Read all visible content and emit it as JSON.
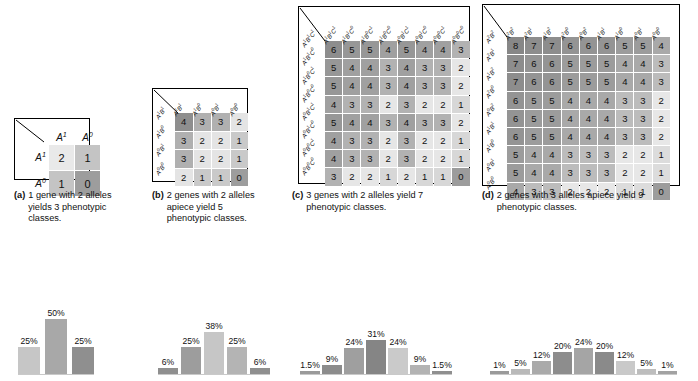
{
  "panels": [
    {
      "id": "a",
      "tag": "(a)",
      "caption": "1 gene with 2 alleles yields 3 phenotypic classes.",
      "col_labels": [
        "A1",
        "A0"
      ],
      "row_labels": [
        "A1",
        "A0"
      ],
      "col_labels_html": [
        "A<sup>1</sup>",
        "A<sup>0</sup>"
      ],
      "row_labels_html": [
        "A<sup>1</sup>",
        "A<sup>0</sup>"
      ],
      "label_style": "plain",
      "matrix": [
        [
          2,
          1
        ],
        [
          1,
          0
        ]
      ]
    },
    {
      "id": "b",
      "tag": "(b)",
      "caption": "2 genes with 2 alleles apiece yield 5 phenotypic classes.",
      "col_labels": [
        "A1B1",
        "A1B0",
        "A0B1",
        "A0B0"
      ],
      "row_labels": [
        "A1B1",
        "A1B0",
        "A0B1",
        "A0B0"
      ],
      "label_style": "diagonal",
      "matrix": [
        [
          4,
          3,
          3,
          2
        ],
        [
          3,
          2,
          2,
          1
        ],
        [
          3,
          2,
          2,
          1
        ],
        [
          2,
          1,
          1,
          0
        ]
      ]
    },
    {
      "id": "c",
      "tag": "(c)",
      "caption": "3 genes with 2 alleles yield 7 phenotypic classes.",
      "col_labels": [
        "A1B1C1",
        "A1B1C0",
        "A1B0C1",
        "A1B0C0",
        "A0B1C1",
        "A0B1C0",
        "A0B0C1",
        "A0B0C0"
      ],
      "row_labels": [
        "A1B1C1",
        "A1B1C0",
        "A1B0C1",
        "A1B0C0",
        "A0B1C1",
        "A0B1C0",
        "A0B0C1",
        "A0B0C0"
      ],
      "label_style": "diagonal",
      "matrix": [
        [
          6,
          5,
          5,
          4,
          5,
          4,
          4,
          3
        ],
        [
          5,
          4,
          4,
          3,
          4,
          3,
          3,
          2
        ],
        [
          5,
          4,
          4,
          3,
          4,
          3,
          3,
          2
        ],
        [
          4,
          3,
          3,
          2,
          3,
          2,
          2,
          1
        ],
        [
          5,
          4,
          4,
          3,
          4,
          3,
          3,
          2
        ],
        [
          4,
          3,
          3,
          2,
          3,
          2,
          2,
          1
        ],
        [
          4,
          3,
          3,
          2,
          3,
          2,
          2,
          1
        ],
        [
          3,
          2,
          2,
          1,
          2,
          1,
          1,
          0
        ]
      ]
    },
    {
      "id": "d",
      "tag": "(d)",
      "caption": "2 genes with 3 alleles apiece yield 9 phenotypic classes.",
      "col_labels": [
        "A2B2",
        "A2B1",
        "A1B2",
        "A2B0",
        "A0B2",
        "A1B1",
        "A1B0",
        "A0B1",
        "A0B0"
      ],
      "row_labels": [
        "A2B2",
        "A2B1",
        "A1B2",
        "A2B0",
        "A0B2",
        "A1B1",
        "A1B0",
        "A0B1",
        "A0B0"
      ],
      "label_style": "diagonal",
      "matrix": [
        [
          8,
          7,
          7,
          6,
          6,
          6,
          5,
          5,
          4
        ],
        [
          7,
          6,
          6,
          5,
          5,
          5,
          4,
          4,
          3
        ],
        [
          7,
          6,
          6,
          5,
          5,
          5,
          4,
          4,
          3
        ],
        [
          6,
          5,
          5,
          4,
          4,
          4,
          3,
          3,
          2
        ],
        [
          6,
          5,
          5,
          4,
          4,
          4,
          3,
          3,
          2
        ],
        [
          6,
          5,
          5,
          4,
          4,
          4,
          3,
          3,
          2
        ],
        [
          5,
          4,
          4,
          3,
          3,
          3,
          2,
          2,
          1
        ],
        [
          5,
          4,
          4,
          3,
          3,
          3,
          2,
          2,
          1
        ],
        [
          4,
          3,
          3,
          2,
          2,
          2,
          1,
          1,
          0
        ]
      ]
    }
  ],
  "chart_data": [
    {
      "type": "bar",
      "id": "chart-a",
      "title": "",
      "xlabel": "",
      "ylabel": "",
      "categories": [
        "0",
        "1",
        "2"
      ],
      "values": [
        25,
        50,
        25
      ],
      "labels": [
        "25%",
        "50%",
        "25%"
      ],
      "colors": [
        "#c6c6c6",
        "#a8a8a8",
        "#8f8f8f"
      ],
      "ylim": [
        0,
        55
      ],
      "grid": false
    },
    {
      "type": "bar",
      "id": "chart-b",
      "title": "",
      "xlabel": "",
      "ylabel": "",
      "categories": [
        "0",
        "1",
        "2",
        "3",
        "4"
      ],
      "values": [
        6,
        25,
        38,
        25,
        6
      ],
      "labels": [
        "6%",
        "25%",
        "38%",
        "25%",
        "6%"
      ],
      "colors": [
        "#8f8f8f",
        "#9d9d9d",
        "#c6c6c6",
        "#b4b4b4",
        "#8f8f8f"
      ],
      "ylim": [
        0,
        55
      ],
      "grid": false
    },
    {
      "type": "bar",
      "id": "chart-c",
      "title": "",
      "xlabel": "",
      "ylabel": "",
      "categories": [
        "0",
        "1",
        "2",
        "3",
        "4",
        "5",
        "6"
      ],
      "values": [
        1.5,
        9,
        24,
        31,
        24,
        9,
        1.5
      ],
      "labels": [
        "1.5%",
        "9%",
        "24%",
        "31%",
        "24%",
        "9%",
        "1.5%"
      ],
      "colors": [
        "#9a9a9a",
        "#8c8c8c",
        "#9f9f9f",
        "#858585",
        "#cacaca",
        "#b3b3b3",
        "#8f8f8f"
      ],
      "ylim": [
        0,
        55
      ],
      "grid": false
    },
    {
      "type": "bar",
      "id": "chart-d",
      "title": "",
      "xlabel": "",
      "ylabel": "",
      "categories": [
        "0",
        "1",
        "2",
        "3",
        "4",
        "5",
        "6",
        "7",
        "8"
      ],
      "values": [
        1,
        5,
        12,
        20,
        24,
        20,
        12,
        5,
        1
      ],
      "labels": [
        "1%",
        "5%",
        "12%",
        "20%",
        "24%",
        "20%",
        "12%",
        "5%",
        "1%"
      ],
      "colors": [
        "#9a9a9a",
        "#b9b9b9",
        "#aaaaaa",
        "#8d8d8d",
        "#a5a5a5",
        "#8a8a8a",
        "#c9c9c9",
        "#bdbdbd",
        "#a2a2a2"
      ],
      "ylim": [
        0,
        55
      ],
      "grid": false
    }
  ]
}
